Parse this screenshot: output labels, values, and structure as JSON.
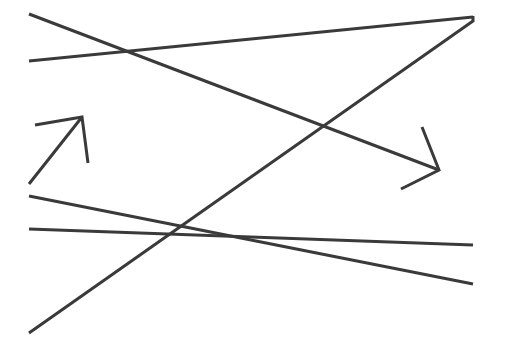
{
  "canvas": {
    "width": 505,
    "height": 359,
    "background": "#ffffff"
  },
  "style": {
    "stroke": "#3a3a3a",
    "stroke_width": 3
  },
  "lines": [
    {
      "id": "long-diagonal-down",
      "x1": 29,
      "y1": 14,
      "x2": 439,
      "y2": 170
    },
    {
      "id": "top-shallow-rise",
      "x1": 29,
      "y1": 61,
      "x2": 473,
      "y2": 17
    },
    {
      "id": "long-diagonal-up",
      "x1": 29,
      "y1": 333,
      "x2": 473,
      "y2": 21
    },
    {
      "id": "right-edge-short",
      "x1": 473,
      "y1": 16,
      "x2": 473,
      "y2": 22
    },
    {
      "id": "lower-descending",
      "x1": 29,
      "y1": 196,
      "x2": 473,
      "y2": 284
    },
    {
      "id": "lower-near-horizontal",
      "x1": 29,
      "y1": 229,
      "x2": 473,
      "y2": 245
    },
    {
      "id": "left-arrow-shaft",
      "x1": 29,
      "y1": 184,
      "x2": 82,
      "y2": 117
    }
  ],
  "arrowheads": [
    {
      "id": "left-arrow-head",
      "points": "35,125 82,117 88,163"
    },
    {
      "id": "right-arrow-head",
      "points": "422,127 439,170 401,189"
    }
  ]
}
